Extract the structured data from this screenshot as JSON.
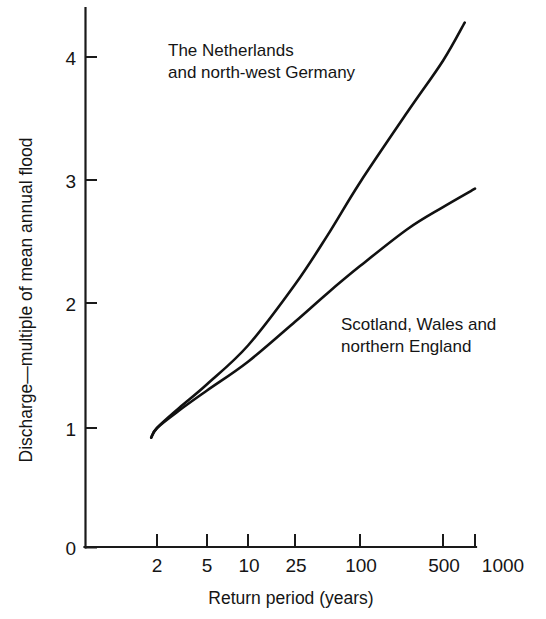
{
  "chart_data": {
    "type": "line",
    "title": "",
    "subtitle": "",
    "xlabel": "Return period (years)",
    "ylabel": "Discharge—multiple of mean annual flood",
    "x_scale": "gumbel-probability",
    "x_tick_labels": [
      "2",
      "5",
      "10",
      "25",
      "100",
      "500",
      "1000"
    ],
    "x_tick_values": [
      2,
      5,
      10,
      25,
      100,
      500,
      1000
    ],
    "y_tick_labels": [
      "0",
      "1",
      "2",
      "3",
      "4"
    ],
    "y_tick_values": [
      0,
      1,
      2,
      3,
      4
    ],
    "ylim": [
      0,
      4.4
    ],
    "xlim": [
      1.6,
      1000
    ],
    "grid": false,
    "legend_position": "inline-annotations",
    "series": [
      {
        "name": "The Netherlands and north-west Germany",
        "annotation_line1": "The Netherlands",
        "annotation_line2": "and north-west Germany",
        "color": "#111111",
        "x": [
          1.8,
          2,
          3,
          5,
          10,
          25,
          50,
          100,
          250,
          500,
          800
        ],
        "values": [
          0.92,
          1.0,
          1.16,
          1.35,
          1.66,
          2.15,
          2.55,
          2.98,
          3.55,
          3.97,
          4.28
        ]
      },
      {
        "name": "Scotland, Wales and northern England",
        "annotation_line1": "Scotland, Wales and",
        "annotation_line2": "northern England",
        "color": "#111111",
        "x": [
          1.8,
          2,
          3,
          5,
          10,
          25,
          50,
          100,
          250,
          500,
          1000
        ],
        "values": [
          0.92,
          1.0,
          1.14,
          1.3,
          1.53,
          1.85,
          2.08,
          2.3,
          2.6,
          2.78,
          2.93
        ]
      }
    ],
    "colors": {
      "axis": "#1a1a1a",
      "series": "#111111",
      "background": "#ffffff",
      "text": "#151515"
    }
  }
}
